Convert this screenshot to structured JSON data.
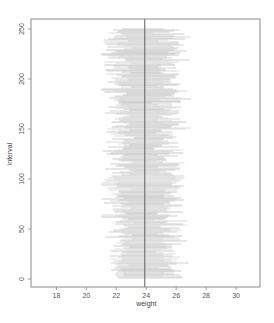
{
  "chart_data": {
    "type": "interval",
    "title": "",
    "xlabel": "weight",
    "ylabel": "interval",
    "xlim": [
      16.3,
      31.6
    ],
    "ylim": [
      -8,
      260
    ],
    "xticks": [
      18,
      20,
      22,
      24,
      26,
      28,
      30
    ],
    "yticks": [
      0,
      50,
      100,
      150,
      200,
      250
    ],
    "reference_line": {
      "x": 23.9,
      "orientation": "vertical",
      "color": "#6b6b6b"
    },
    "n_intervals": 250,
    "interval_center_mean": 23.9,
    "interval_range_approx": [
      21.0,
      26.5
    ],
    "segment_color": "#c8c8c8",
    "grid": false,
    "legend": null
  },
  "colors": {
    "frame": "#8a8a8a",
    "segments": "#c8c8c8",
    "reference": "#6b6b6b",
    "text": "#555555"
  }
}
